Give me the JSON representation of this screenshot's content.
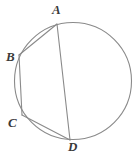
{
  "figure": {
    "type": "geometry-diagram",
    "width": 137,
    "height": 157,
    "background_color": "#ffffff",
    "stroke_color": "#8a8a8a",
    "label_color": "#3a3a3a",
    "stroke_width": 1.1,
    "circle": {
      "name": "circumscribed-circle",
      "cx": 73,
      "cy": 81,
      "r": 58.5
    },
    "points": [
      {
        "id": "A",
        "label": "A",
        "x": 57,
        "y": 24,
        "label_x": 52,
        "label_y": 3
      },
      {
        "id": "B",
        "label": "B",
        "x": 19,
        "y": 55,
        "label_x": 6,
        "label_y": 50
      },
      {
        "id": "C",
        "label": "C",
        "x": 22,
        "y": 115,
        "label_x": 8,
        "label_y": 116
      },
      {
        "id": "D",
        "label": "D",
        "x": 70,
        "y": 140,
        "label_x": 68,
        "label_y": 140
      }
    ],
    "chords": [
      {
        "name": "chord-AB",
        "from": "A",
        "to": "B"
      },
      {
        "name": "chord-BC",
        "from": "B",
        "to": "C"
      },
      {
        "name": "chord-CD",
        "from": "C",
        "to": "D"
      },
      {
        "name": "chord-AD",
        "from": "A",
        "to": "D"
      }
    ]
  }
}
